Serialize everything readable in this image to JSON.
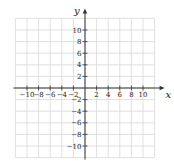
{
  "chart_data": {
    "type": "scatter",
    "title": "",
    "xlabel": "x",
    "ylabel": "y",
    "xlim": [
      -12,
      12
    ],
    "ylim": [
      -12,
      12
    ],
    "grid": true,
    "grid_step": 2,
    "x_ticks": [
      -10,
      -8,
      -6,
      -4,
      -2,
      2,
      4,
      6,
      8,
      10
    ],
    "y_ticks": [
      -10,
      -8,
      -6,
      -4,
      -2,
      2,
      4,
      6,
      8,
      10
    ],
    "x_tick_labels": [
      "−10",
      "−8",
      "−6",
      "−4",
      "−2",
      "2",
      "4",
      "6",
      "8",
      "10"
    ],
    "y_tick_labels": [
      "−10",
      "−8",
      "−6",
      "−4",
      "−2",
      "2",
      "4",
      "6",
      "8",
      "10"
    ],
    "series": [],
    "legend": null,
    "annotations": []
  },
  "colors": {
    "grid": "#d8d8d8",
    "axis": "#333333",
    "text": "#222222"
  }
}
